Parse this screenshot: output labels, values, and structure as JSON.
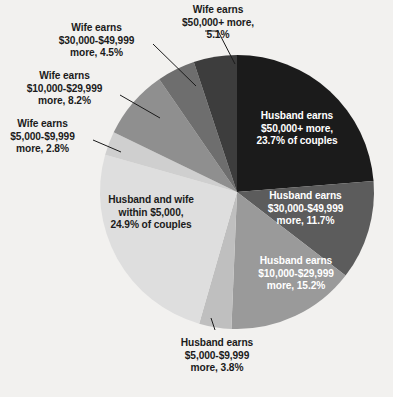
{
  "chart_data": {
    "type": "pie",
    "title": "",
    "subtitle": "",
    "xlabel": "",
    "ylabel": "",
    "legend_position": "none",
    "grid": false,
    "unit": "percent of couples",
    "categories": [
      "Husband earns $50,000+ more",
      "Husband earns $30,000-$49,999 more",
      "Husband earns $10,000-$29,999 more",
      "Husband earns $5,000-$9,999 more",
      "Husband and wife within $5,000",
      "Wife earns $5,000-$9,999 more",
      "Wife earns $10,000-$29,999 more",
      "Wife earns $30,000-$49,999 more",
      "Wife earns $50,000+ more"
    ],
    "values": [
      23.7,
      11.7,
      15.2,
      3.8,
      24.9,
      2.8,
      8.2,
      4.5,
      5.1
    ],
    "colors": [
      "#1b1b1b",
      "#5c5c5c",
      "#9a9a9a",
      "#bfbfbf",
      "#dedede",
      "#cfcfcf",
      "#8f8f8f",
      "#6e6e6e",
      "#3d3d3d"
    ],
    "slices": [
      {
        "id": "husband-50000-plus",
        "label": "Husband earns\n$50,000+ more,\n23.7% of couples",
        "value": 23.7,
        "color": "#1b1b1b",
        "label_placement": "inside",
        "text_color": "#ffffff"
      },
      {
        "id": "husband-30000-49999",
        "label": "Husband earns\n$30,000-$49,999\nmore, 11.7%",
        "value": 11.7,
        "color": "#5c5c5c",
        "label_placement": "inside",
        "text_color": "#ffffff"
      },
      {
        "id": "husband-10000-29999",
        "label": "Husband earns\n$10,000-$29,999\nmore, 15.2%",
        "value": 15.2,
        "color": "#9a9a9a",
        "label_placement": "inside",
        "text_color": "#ffffff"
      },
      {
        "id": "husband-5000-9999",
        "label": "Husband earns\n$5,000-$9,999\nmore, 3.8%",
        "value": 3.8,
        "color": "#bfbfbf",
        "label_placement": "callout",
        "text_color": "#1b1b1b"
      },
      {
        "id": "within-5000",
        "label": "Husband and wife\nwithin $5,000,\n24.9% of couples",
        "value": 24.9,
        "color": "#dedede",
        "label_placement": "inside",
        "text_color": "#1b1b1b"
      },
      {
        "id": "wife-5000-9999",
        "label": "Wife earns\n$5,000-$9,999\nmore, 2.8%",
        "value": 2.8,
        "color": "#cfcfcf",
        "label_placement": "callout",
        "text_color": "#1b1b1b"
      },
      {
        "id": "wife-10000-29999",
        "label": "Wife earns\n$10,000-$29,999\nmore, 8.2%",
        "value": 8.2,
        "color": "#8f8f8f",
        "label_placement": "callout",
        "text_color": "#1b1b1b"
      },
      {
        "id": "wife-30000-49999",
        "label": "Wife earns\n$30,000-$49,999\nmore, 4.5%",
        "value": 4.5,
        "color": "#6e6e6e",
        "label_placement": "callout",
        "text_color": "#1b1b1b"
      },
      {
        "id": "wife-50000-plus",
        "label": "Wife earns\n$50,000+ more,\n5.1%",
        "value": 5.1,
        "color": "#3d3d3d",
        "label_placement": "callout",
        "text_color": "#1b1b1b"
      }
    ],
    "background_color": "#f2f1ef",
    "start_angle_deg": 0,
    "direction": "clockwise",
    "center": {
      "x": 237,
      "y": 192
    },
    "radius": 137
  },
  "labels": {
    "wife_50000_plus": "Wife earns\n$50,000+ more,\n5.1%",
    "wife_30000_49999": "Wife earns\n$30,000-$49,999\nmore, 4.5%",
    "wife_10000_29999": "Wife earns\n$10,000-$29,999\nmore, 8.2%",
    "wife_5000_9999": "Wife earns\n$5,000-$9,999\nmore, 2.8%",
    "within_5000": "Husband and wife\nwithin $5,000,\n24.9% of couples",
    "husband_5000_9999": "Husband earns\n$5,000-$9,999\nmore, 3.8%",
    "husband_10000_29999": "Husband earns\n$10,000-$29,999\nmore, 15.2%",
    "husband_30000_49999": "Husband earns\n$30,000-$49,999\nmore, 11.7%",
    "husband_50000_plus": "Husband earns\n$50,000+ more,\n23.7% of couples"
  }
}
